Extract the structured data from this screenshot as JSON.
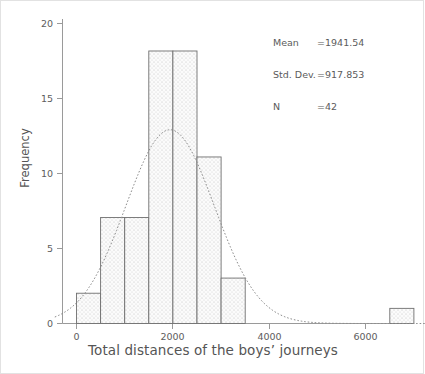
{
  "chart_data": {
    "type": "bar",
    "title": "",
    "xlabel": "Total distances of the boys’ journeys",
    "ylabel": "Frequency",
    "xlim": [
      -400,
      7250
    ],
    "ylim": [
      0,
      21
    ],
    "grid": false,
    "legend": null,
    "bin_width": 500,
    "categories": [
      "0–500",
      "500–1000",
      "1000–1500",
      "1500–2000",
      "2000–2500",
      "2500–3000",
      "3000–3500",
      "6500–7000"
    ],
    "bins": [
      {
        "start": 0,
        "end": 500,
        "value": 2
      },
      {
        "start": 500,
        "end": 1000,
        "value": 7
      },
      {
        "start": 1000,
        "end": 1500,
        "value": 7
      },
      {
        "start": 1500,
        "end": 2000,
        "value": 18
      },
      {
        "start": 2000,
        "end": 2500,
        "value": 18
      },
      {
        "start": 2500,
        "end": 3000,
        "value": 11
      },
      {
        "start": 3000,
        "end": 3500,
        "value": 3
      },
      {
        "start": 6500,
        "end": 7000,
        "value": 1
      }
    ],
    "values": [
      2,
      7,
      7,
      18,
      18,
      11,
      3,
      1
    ],
    "xticks": [
      0,
      2000,
      4000,
      6000
    ],
    "xtick_labels": [
      "0",
      "2000",
      "4000",
      "6000"
    ],
    "yticks": [
      0,
      5,
      10,
      15,
      20
    ],
    "ytick_labels": [
      "0",
      "5",
      "10",
      "15",
      "20"
    ],
    "overlay_curve": {
      "name": "normal-distribution-curve",
      "mean": 1941.54,
      "std_dev": 917.853,
      "peak_frequency": 12.8,
      "style": "dotted"
    },
    "bar_fill": "stippled-dots",
    "bar_edge_color": "#6b6b6b",
    "axis_color": "#8a8a8a",
    "text_color": "#555555"
  },
  "stats_box": {
    "name": "statistics-annotation",
    "rows": [
      {
        "label": "Mean",
        "eq": "=",
        "value": "1941.54"
      },
      {
        "label": "Std. Dev.",
        "eq": "=",
        "value": "917.853"
      },
      {
        "label": "N",
        "eq": "=",
        "value": "42"
      }
    ],
    "mean_label": "Mean",
    "mean_value": "1941.54",
    "std_label": "Std. Dev.",
    "std_value": "917.853",
    "n_label": "N",
    "n_value": "42",
    "equals": "="
  },
  "axes": {
    "x_title": "Total distances of the boys’ journeys",
    "y_title": "Frequency",
    "x_tick_0": "0",
    "x_tick_1": "2000",
    "x_tick_2": "4000",
    "x_tick_3": "6000",
    "y_tick_0": "0",
    "y_tick_1": "5",
    "y_tick_2": "10",
    "y_tick_3": "15",
    "y_tick_4": "20"
  }
}
